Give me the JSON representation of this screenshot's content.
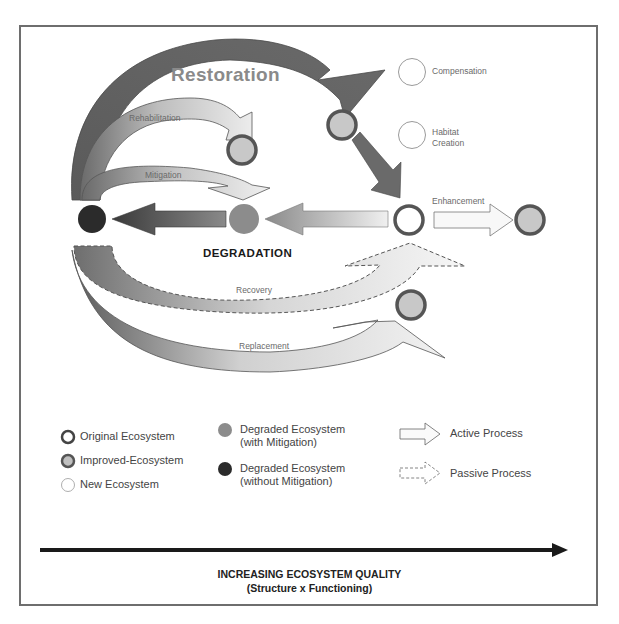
{
  "diagram": {
    "processes": {
      "restoration": "Restoration",
      "rehabilitation": "Rehabilitation",
      "mitigation": "Mitigation",
      "compensation": "Compensation",
      "habitat_creation_line1": "Habitat",
      "habitat_creation_line2": "Creation",
      "enhancement": "Enhancement",
      "degradation": "DEGRADATION",
      "recovery": "Recovery",
      "replacement": "Replacement"
    },
    "nodes": [
      {
        "id": "degraded-without-mitigation",
        "type": "degraded_without_mitigation",
        "x": 92,
        "y": 219
      },
      {
        "id": "degraded-with-mitigation",
        "type": "degraded_with_mitigation",
        "x": 244,
        "y": 219
      },
      {
        "id": "original",
        "type": "original",
        "x": 409,
        "y": 220
      },
      {
        "id": "enhanced",
        "type": "improved",
        "x": 530,
        "y": 220
      },
      {
        "id": "rehabilitated",
        "type": "improved",
        "x": 242,
        "y": 150
      },
      {
        "id": "restoration-intermediate",
        "type": "improved",
        "x": 342,
        "y": 125
      },
      {
        "id": "compensation",
        "type": "new",
        "x": 412,
        "y": 72
      },
      {
        "id": "habitat-creation",
        "type": "new",
        "x": 412,
        "y": 135
      },
      {
        "id": "replacement-target",
        "type": "improved",
        "x": 411,
        "y": 305
      }
    ]
  },
  "legend": {
    "original": "Original Ecosystem",
    "improved": "Improved-Ecosystem",
    "new": "New Ecosystem",
    "degraded_with_line1": "Degraded Ecosystem",
    "degraded_with_line2": "(with Mitigation)",
    "degraded_without_line1": "Degraded Ecosystem",
    "degraded_without_line2": "(without Mitigation)",
    "active": "Active Process",
    "passive": "Passive Process"
  },
  "axis": {
    "title": "INCREASING ECOSYSTEM QUALITY",
    "subtitle": "(Structure x Functioning)"
  },
  "colors": {
    "frame": "#6e6e6e",
    "dark_node": "#2b2b2b",
    "mid_node": "#8c8c8c",
    "improved_fill": "#c8c8c8",
    "ring": "#555555",
    "arrow_dark": "#5a5a5a",
    "arrow_light": "#e6e6e6"
  }
}
